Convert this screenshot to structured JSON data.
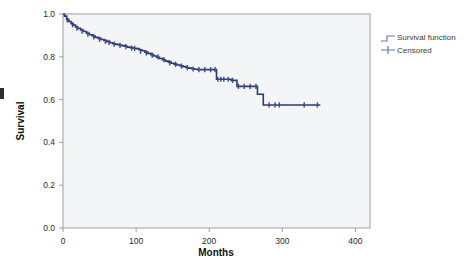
{
  "figure": {
    "type": "kaplan-meier-survival-plot",
    "background_color": "#ffffff",
    "plot_area_color": "#f3f5f7",
    "plot_border_color": "#9aa0a6",
    "curve_color": "#2e3a78",
    "censor_color": "#3d4a8a",
    "legend_line_color": "#6b76a8"
  },
  "axes": {
    "x_title": "Months",
    "y_title": "Survival",
    "x_ticks": [
      "0",
      "100",
      "200",
      "300",
      "400"
    ],
    "y_ticks": [
      "1.0",
      "0.8",
      "0.6",
      "0.4",
      "0.2",
      "0.0"
    ]
  },
  "legend": {
    "items": [
      {
        "label": "Survival function",
        "marker": "step-line-icon"
      },
      {
        "label": "Censored",
        "marker": "plus-tick-icon"
      }
    ]
  },
  "chart_data": {
    "type": "line",
    "title": "",
    "xlabel": "Months",
    "ylabel": "Survival",
    "xlim": [
      0,
      420
    ],
    "ylim": [
      0.0,
      1.0
    ],
    "xticks": [
      0,
      100,
      200,
      300,
      400
    ],
    "yticks": [
      0.0,
      0.2,
      0.4,
      0.6,
      0.8,
      1.0
    ],
    "grid": false,
    "legend_position": "right-outside",
    "series": [
      {
        "name": "Survival function",
        "kind": "step",
        "x": [
          0,
          2,
          5,
          8,
          11,
          14,
          17,
          20,
          24,
          28,
          32,
          36,
          40,
          44,
          48,
          52,
          56,
          60,
          64,
          68,
          72,
          76,
          80,
          84,
          88,
          92,
          96,
          100,
          104,
          108,
          112,
          116,
          120,
          124,
          128,
          132,
          136,
          140,
          144,
          148,
          152,
          156,
          160,
          164,
          168,
          172,
          176,
          180,
          184,
          188,
          192,
          196,
          200,
          206,
          210,
          214,
          222,
          230,
          238,
          246,
          254,
          262,
          266,
          270,
          274,
          278,
          300,
          320,
          340,
          352
        ],
        "y": [
          1.0,
          0.99,
          0.975,
          0.965,
          0.955,
          0.948,
          0.94,
          0.933,
          0.925,
          0.918,
          0.91,
          0.903,
          0.897,
          0.891,
          0.886,
          0.881,
          0.876,
          0.871,
          0.866,
          0.861,
          0.858,
          0.855,
          0.852,
          0.849,
          0.845,
          0.842,
          0.84,
          0.838,
          0.833,
          0.828,
          0.822,
          0.816,
          0.81,
          0.804,
          0.798,
          0.792,
          0.786,
          0.78,
          0.775,
          0.77,
          0.766,
          0.762,
          0.758,
          0.754,
          0.75,
          0.747,
          0.744,
          0.742,
          0.74,
          0.74,
          0.74,
          0.74,
          0.74,
          0.74,
          0.695,
          0.695,
          0.695,
          0.69,
          0.662,
          0.662,
          0.662,
          0.662,
          0.625,
          0.625,
          0.575,
          0.575,
          0.575,
          0.575,
          0.575,
          0.575
        ]
      },
      {
        "name": "Censored",
        "kind": "tick-markers",
        "x": [
          6,
          13,
          19,
          26,
          34,
          42,
          50,
          58,
          63,
          70,
          78,
          86,
          94,
          98,
          106,
          114,
          122,
          130,
          138,
          146,
          154,
          162,
          170,
          178,
          186,
          194,
          202,
          208,
          212,
          216,
          220,
          226,
          232,
          240,
          248,
          256,
          264,
          282,
          290,
          296,
          330,
          348
        ],
        "y": [
          0.972,
          0.95,
          0.934,
          0.92,
          0.906,
          0.893,
          0.882,
          0.872,
          0.867,
          0.859,
          0.853,
          0.848,
          0.841,
          0.839,
          0.826,
          0.818,
          0.808,
          0.8,
          0.787,
          0.772,
          0.765,
          0.757,
          0.749,
          0.743,
          0.74,
          0.74,
          0.74,
          0.74,
          0.695,
          0.695,
          0.695,
          0.695,
          0.69,
          0.662,
          0.662,
          0.662,
          0.662,
          0.575,
          0.575,
          0.575,
          0.575,
          0.575
        ]
      }
    ]
  }
}
